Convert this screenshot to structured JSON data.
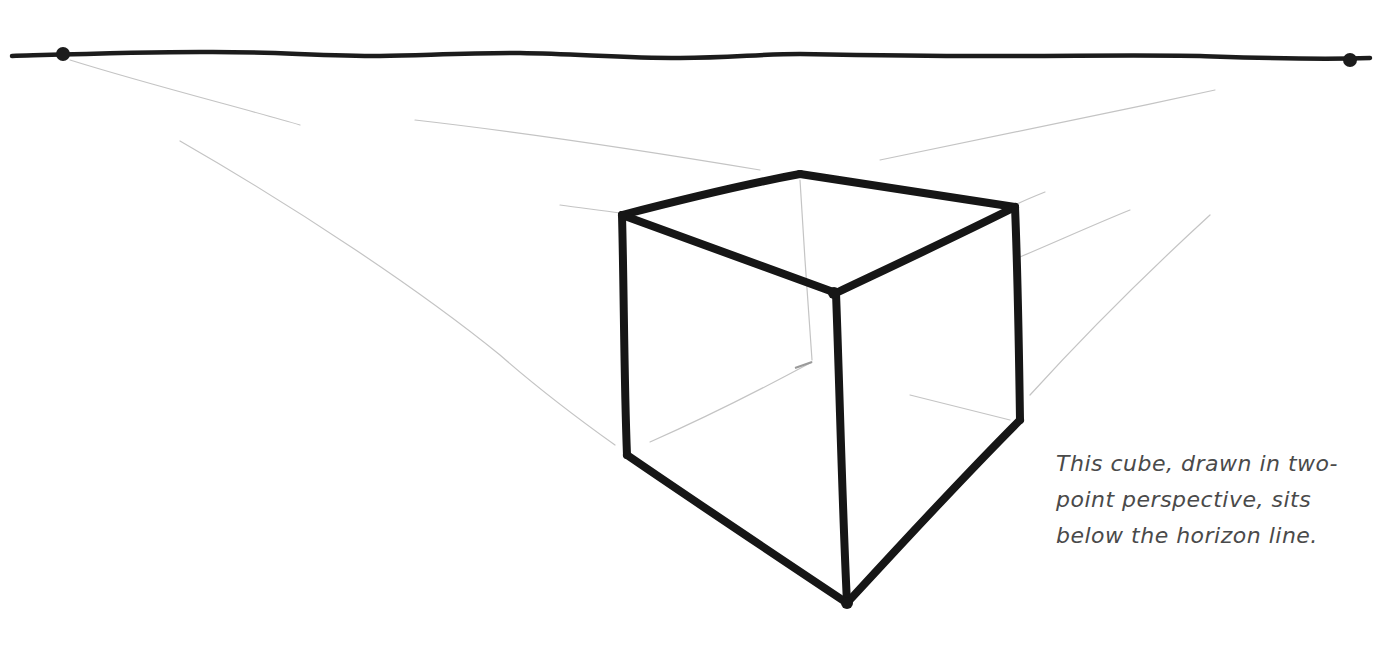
{
  "diagram": {
    "colors": {
      "ink": "#1a1a1a",
      "guide": "#c8c8c8",
      "caption": "#4a4a4a",
      "background": "#ffffff"
    },
    "horizon_line": {
      "label": "horizon line",
      "y": 56,
      "x_start": 12,
      "x_end": 1370
    },
    "vanishing_points": [
      {
        "name": "left-vanishing-point",
        "x": 63,
        "y": 53
      },
      {
        "name": "right-vanishing-point",
        "x": 1350,
        "y": 61
      }
    ],
    "cube": {
      "vertices": {
        "top_back": [
          800,
          174
        ],
        "top_left": [
          622,
          215
        ],
        "top_right": [
          1015,
          207
        ],
        "top_front": [
          836,
          293
        ],
        "bottom_left": [
          627,
          455
        ],
        "bottom_right": [
          1020,
          420
        ],
        "bottom_front": [
          847,
          603
        ],
        "hidden_back_bottom": [
          812,
          365
        ]
      }
    },
    "caption": {
      "lines": [
        "This cube, drawn in two-",
        "point perspective, sits",
        "below the horizon line."
      ]
    }
  }
}
